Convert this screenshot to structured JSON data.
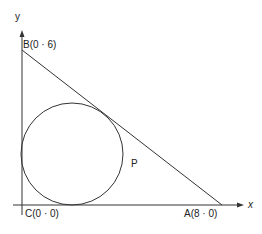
{
  "diagram": {
    "type": "geometry",
    "axes": {
      "x_label": "x",
      "y_label": "y"
    },
    "points": {
      "A": {
        "label": "A(8 · 0)",
        "coords": [
          8,
          0
        ]
      },
      "B": {
        "label": "B(0 · 6)",
        "coords": [
          0,
          6
        ]
      },
      "C": {
        "label": "C(0 · 0)",
        "coords": [
          0,
          0
        ]
      },
      "P": {
        "label": "P"
      }
    },
    "circle": {
      "description": "incircle of triangle ABC",
      "center": [
        2,
        2
      ],
      "radius": 2
    },
    "colors": {
      "stroke": "#333333",
      "background": "#ffffff"
    }
  }
}
